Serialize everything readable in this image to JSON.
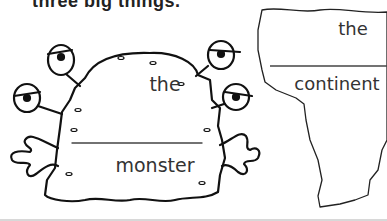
{
  "title": "three big things.",
  "cards": [
    {
      "name": "monster",
      "article": "the",
      "word": "monster"
    },
    {
      "name": "continent",
      "article": "the",
      "word": "continent"
    }
  ],
  "colors": {
    "ink": "#222222",
    "text": "#333333",
    "background": "#ffffff"
  }
}
